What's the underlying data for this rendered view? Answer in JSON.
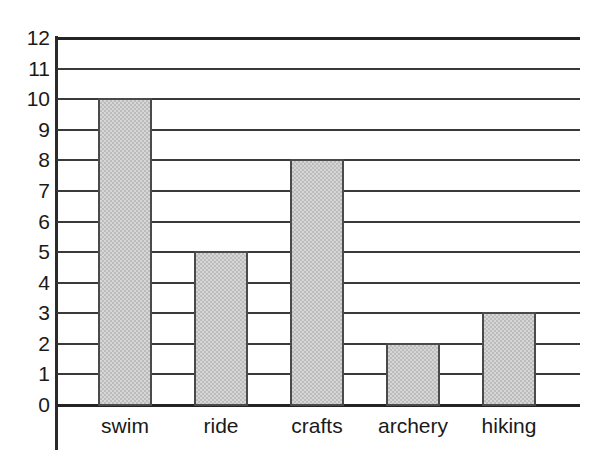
{
  "chart_data": {
    "type": "bar",
    "title": "",
    "subtitle": "",
    "xlabel": "",
    "ylabel": "",
    "categories": [
      "swim",
      "ride",
      "crafts",
      "archery",
      "hiking"
    ],
    "values": [
      10,
      5,
      8,
      2,
      3
    ],
    "ylim": [
      0,
      12
    ],
    "y_ticks": [
      0,
      1,
      2,
      3,
      4,
      5,
      6,
      7,
      8,
      9,
      10,
      11,
      12
    ],
    "y_tick_labels": [
      "0",
      "1",
      "2",
      "3",
      "4",
      "5",
      "6",
      "7",
      "8",
      "9",
      "10",
      "11",
      "12"
    ],
    "grid": true,
    "grid_axis": "y",
    "legend": false,
    "legend_position": "none",
    "annotations": [],
    "series": [
      {
        "name": "",
        "values": [
          10,
          5,
          8,
          2,
          3
        ]
      }
    ],
    "colors": {
      "bar_fill": "#d6d6d6",
      "bar_pattern": "#bcbcbc",
      "bar_border": "#4a4a4a",
      "gridline": "#3a3a3a",
      "axis": "#242424",
      "text": "#1a1a1a",
      "background": "#ffffff"
    }
  }
}
